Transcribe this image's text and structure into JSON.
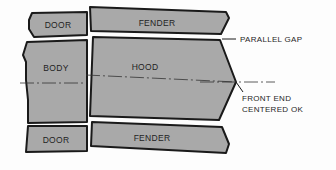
{
  "diagram": {
    "type": "body-panel-alignment",
    "panels": [
      {
        "id": "door-top",
        "label": "DOOR"
      },
      {
        "id": "fender-top",
        "label": "FENDER"
      },
      {
        "id": "body",
        "label": "BODY"
      },
      {
        "id": "hood",
        "label": "HOOD"
      },
      {
        "id": "door-bottom",
        "label": "DOOR"
      },
      {
        "id": "fender-bottom",
        "label": "FENDER"
      }
    ],
    "callouts": {
      "parallel_gap": "PARALLEL GAP",
      "front_end_line1": "FRONT END",
      "front_end_line2": "CENTERED OK"
    },
    "colors": {
      "panel_fill": "#a9a9a9",
      "outline": "#1a1a1a",
      "background": "#fdfdfd"
    }
  }
}
